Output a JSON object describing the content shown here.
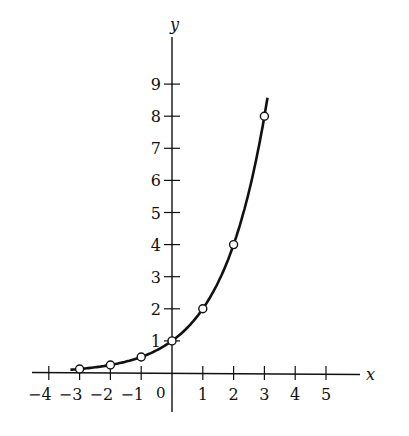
{
  "chart_data": {
    "type": "line",
    "title": "",
    "function": "y = 2^x",
    "xlabel": "x",
    "ylabel": "y",
    "x_ticks": [
      -4,
      -3,
      -2,
      -1,
      0,
      1,
      2,
      3,
      4,
      5
    ],
    "y_ticks": [
      1,
      2,
      3,
      4,
      5,
      6,
      7,
      8,
      9
    ],
    "xlim": [
      -4.3,
      6.3
    ],
    "ylim": [
      -1.2,
      10.5
    ],
    "grid": false,
    "legend": null,
    "series": [
      {
        "name": "y = 2^x",
        "x": [
          -3,
          -2,
          -1,
          0,
          1,
          2,
          3
        ],
        "values": [
          0.125,
          0.25,
          0.5,
          1,
          2,
          4,
          8
        ],
        "markers": "open-circle"
      }
    ],
    "curve_range_x": [
      -3.3,
      3.1
    ]
  }
}
